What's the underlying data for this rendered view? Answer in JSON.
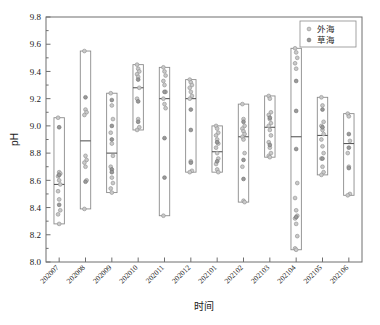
{
  "chart_data": {
    "type": "box",
    "title": "",
    "xlabel": "时间",
    "ylabel": "pH",
    "ylim": [
      8.0,
      9.8
    ],
    "ytick_step": 0.2,
    "yticks": [
      "8.0",
      "8.2",
      "8.4",
      "8.6",
      "8.8",
      "9.0",
      "9.2",
      "9.4",
      "9.6",
      "9.8"
    ],
    "grid": false,
    "legend_position": "top-right",
    "legend": [
      {
        "name": "外海",
        "marker": "open-circle-light",
        "color": "#c9c9c9"
      },
      {
        "name": "草海",
        "marker": "filled-circle-dark",
        "color": "#9a9a9a"
      }
    ],
    "categories": [
      "202007",
      "202008",
      "202009",
      "202010",
      "202011",
      "202012",
      "202101",
      "202102",
      "202103",
      "202104",
      "202105",
      "202106"
    ],
    "boxes": [
      {
        "category": "202007",
        "min": 8.28,
        "max": 9.06,
        "median": 8.57
      },
      {
        "category": "202008",
        "min": 8.39,
        "max": 9.55,
        "median": 8.89
      },
      {
        "category": "202009",
        "min": 8.51,
        "max": 9.24,
        "median": 8.8
      },
      {
        "category": "202010",
        "min": 8.97,
        "max": 9.45,
        "median": 9.28
      },
      {
        "category": "202011",
        "min": 8.34,
        "max": 9.43,
        "median": 9.2
      },
      {
        "category": "202012",
        "min": 8.66,
        "max": 9.34,
        "median": 9.2
      },
      {
        "category": "202101",
        "min": 8.66,
        "max": 9.0,
        "median": 8.81
      },
      {
        "category": "202102",
        "min": 8.44,
        "max": 9.16,
        "median": 8.92
      },
      {
        "category": "202103",
        "min": 8.77,
        "max": 9.22,
        "median": 8.99
      },
      {
        "category": "202104",
        "min": 8.09,
        "max": 9.57,
        "median": 8.92
      },
      {
        "category": "202105",
        "min": 8.64,
        "max": 9.21,
        "median": 8.93
      },
      {
        "category": "202106",
        "min": 8.49,
        "max": 9.09,
        "median": 8.87
      }
    ],
    "series": [
      {
        "name": "外海",
        "points": [
          {
            "category": "202007",
            "values": [
              9.06,
              8.66,
              8.65,
              8.63,
              8.6,
              8.57,
              8.52,
              8.46,
              8.38,
              8.35,
              8.28
            ]
          },
          {
            "category": "202008",
            "values": [
              9.55,
              9.12,
              9.1,
              9.08,
              8.78,
              8.75,
              8.73,
              8.7,
              8.6,
              8.39
            ]
          },
          {
            "category": "202009",
            "values": [
              9.24,
              9.15,
              9.05,
              8.95,
              8.87,
              8.78,
              8.7,
              8.62,
              8.58,
              8.54,
              8.51
            ]
          },
          {
            "category": "202010",
            "values": [
              9.45,
              9.42,
              9.4,
              9.38,
              9.36,
              9.28,
              9.2,
              9.05,
              8.99,
              8.97
            ]
          },
          {
            "category": "202011",
            "values": [
              9.43,
              9.4,
              9.37,
              9.33,
              9.3,
              9.25,
              9.2,
              9.16,
              9.13,
              8.34
            ]
          },
          {
            "category": "202012",
            "values": [
              9.34,
              9.32,
              9.3,
              9.28,
              9.25,
              9.22,
              9.2,
              8.74,
              8.67,
              8.66
            ]
          },
          {
            "category": "202101",
            "values": [
              9.0,
              8.98,
              8.95,
              8.93,
              8.9,
              8.87,
              8.84,
              8.8,
              8.76,
              8.72,
              8.68,
              8.66
            ]
          },
          {
            "category": "202102",
            "values": [
              9.16,
              9.05,
              9.0,
              8.98,
              8.96,
              8.94,
              8.92,
              8.9,
              8.8,
              8.7,
              8.45,
              8.44
            ]
          },
          {
            "category": "202103",
            "values": [
              9.22,
              9.2,
              9.1,
              9.08,
              9.05,
              9.02,
              9.0,
              8.97,
              8.93,
              8.88,
              8.84,
              8.8,
              8.78,
              8.77
            ]
          },
          {
            "category": "202104",
            "values": [
              9.57,
              9.54,
              9.5,
              9.46,
              9.42,
              8.58,
              8.47,
              8.38,
              8.34,
              8.32,
              8.28,
              8.19,
              8.1,
              8.09
            ]
          },
          {
            "category": "202105",
            "values": [
              9.21,
              9.15,
              9.03,
              9.0,
              8.97,
              8.94,
              8.9,
              8.85,
              8.8,
              8.76,
              8.7,
              8.66,
              8.64
            ]
          },
          {
            "category": "202106",
            "values": [
              9.09,
              9.07,
              8.89,
              8.8,
              8.7,
              8.5,
              8.49
            ]
          }
        ]
      },
      {
        "name": "草海",
        "points": [
          {
            "category": "202007",
            "values": [
              8.99,
              8.64,
              8.42
            ]
          },
          {
            "category": "202008",
            "values": [
              9.21,
              8.59
            ]
          },
          {
            "category": "202009",
            "values": [
              9.19,
              9.0,
              8.9,
              8.68,
              8.66
            ]
          },
          {
            "category": "202010",
            "values": [
              9.34,
              9.18,
              9.03
            ]
          },
          {
            "category": "202011",
            "values": [
              9.25,
              8.91,
              8.62
            ]
          },
          {
            "category": "202012",
            "values": [
              9.12,
              8.97,
              8.73
            ]
          },
          {
            "category": "202101",
            "values": [
              8.88,
              8.74
            ]
          },
          {
            "category": "202102",
            "values": [
              9.03,
              8.75,
              8.61
            ]
          },
          {
            "category": "202103",
            "values": [
              9.06,
              8.86
            ]
          },
          {
            "category": "202104",
            "values": [
              9.33,
              9.11,
              8.83,
              8.33
            ]
          },
          {
            "category": "202105",
            "values": [
              9.12,
              8.99,
              8.76
            ]
          },
          {
            "category": "202106",
            "values": [
              8.94,
              8.84,
              8.69
            ]
          }
        ]
      }
    ]
  }
}
